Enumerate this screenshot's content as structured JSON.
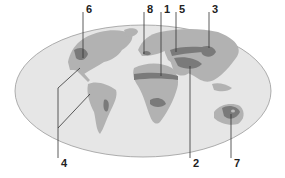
{
  "figure": {
    "type": "world map with numbered callouts",
    "colors": {
      "ocean": "#e6e6e6",
      "ocean_border": "#9a9a9a",
      "land": "#b2b2b2",
      "highlight": "#7a7a7a",
      "leader_line": "#333333"
    }
  },
  "labels": {
    "top": [
      {
        "id": "6",
        "text": "6"
      },
      {
        "id": "8",
        "text": "8"
      },
      {
        "id": "1",
        "text": "1"
      },
      {
        "id": "5",
        "text": "5"
      },
      {
        "id": "3",
        "text": "3"
      }
    ],
    "bottom": [
      {
        "id": "4",
        "text": "4"
      },
      {
        "id": "2",
        "text": "2"
      },
      {
        "id": "7",
        "text": "7"
      }
    ]
  }
}
